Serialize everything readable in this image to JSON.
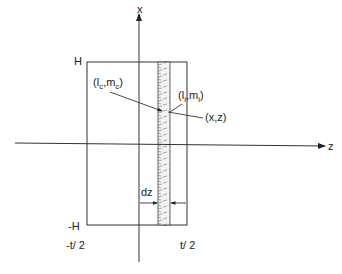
{
  "diagram": {
    "type": "cross-section coordinate sketch",
    "axes": {
      "vertical_label": "x",
      "horizontal_label": "z"
    },
    "bounds": {
      "top_label": "H",
      "bottom_label": "-H",
      "left_label": "-t/ 2",
      "right_label": "t/ 2"
    },
    "points": {
      "center_label": "(lc,mc)",
      "center_label_l": "l",
      "center_label_sub": "c",
      "center_label_m": "m",
      "strip_label": "(li,mi)",
      "strip_label_l": "l",
      "strip_label_sub": "i",
      "strip_label_m": "m",
      "point_label": "(x,z)"
    },
    "strip": {
      "width_label": "dz"
    },
    "colors": {
      "line": "#333333",
      "hatch": "#777777",
      "background": "#ffffff"
    }
  }
}
